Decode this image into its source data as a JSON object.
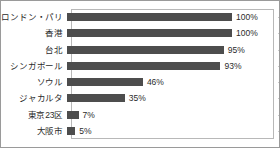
{
  "chart_data": {
    "type": "bar",
    "orientation": "horizontal",
    "title": "",
    "subtitle": "",
    "xlabel": "",
    "ylabel": "",
    "xlim": [
      0,
      100
    ],
    "grid": false,
    "legend": false,
    "value_suffix": "%",
    "bar_color": "#4d4d4d",
    "frame_color": "#9a9a9a",
    "plot_border_color": "#b8b8b8",
    "text_color": "#2b2b2b",
    "categories": [
      "ロンドン・パリ",
      "香港",
      "台北",
      "シンガポール",
      "ソウル",
      "ジャカルタ",
      "東京23区",
      "大阪市"
    ],
    "values": [
      100,
      100,
      95,
      93,
      46,
      35,
      7,
      5
    ],
    "labels": [
      "100%",
      "100%",
      "95%",
      "93%",
      "46%",
      "35%",
      "7%",
      "5%"
    ]
  }
}
